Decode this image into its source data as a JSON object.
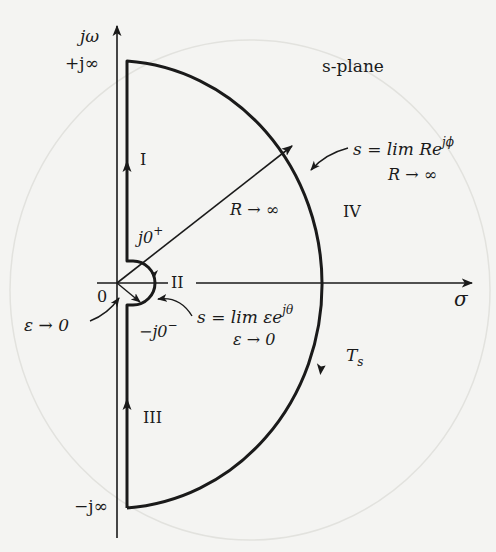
{
  "diagram": {
    "title": "s-plane",
    "axes": {
      "imag_axis_label": "jω",
      "real_axis_label": "σ",
      "origin_label": "0",
      "plus_j_inf": "+j∞",
      "minus_j_inf": "−j∞"
    },
    "sections": {
      "I": "I",
      "II": "II",
      "III": "III",
      "IV": "IV"
    },
    "points": {
      "j0_plus": "j0",
      "j0_plus_sup": "+",
      "j0_minus": "−j0",
      "j0_minus_sup": "−"
    },
    "annotations": {
      "radius_label": "R → ∞",
      "large_arc_eq_main": "s = lim Re",
      "large_arc_eq_sup": "jϕ",
      "large_arc_eq_limit": "R → ∞",
      "small_arc_eq_main": "s = lim εe",
      "small_arc_eq_sup": "jθ",
      "small_arc_eq_limit": "ε → 0",
      "epsilon_label": "ε → 0",
      "contour_label": "T",
      "contour_label_sub": "s"
    },
    "colors": {
      "ink": "#1a1a1a",
      "paper": "#f4f4f2"
    }
  }
}
